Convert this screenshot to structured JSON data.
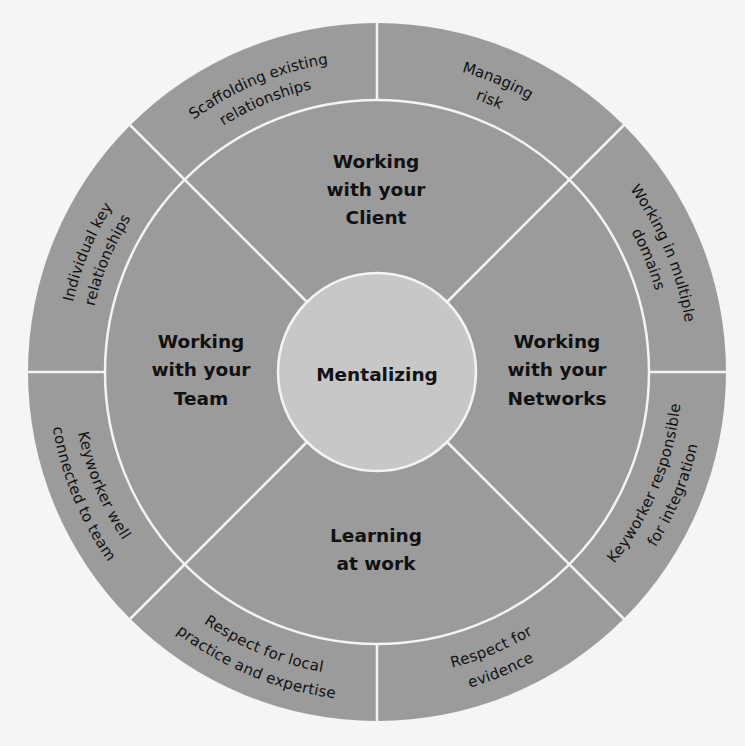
{
  "colors": {
    "background": "#f5f5f4",
    "ring_fill": "#9b9b9b",
    "center_fill": "#c7c7c7",
    "divider": "#f4f4f4",
    "text": "#111111"
  },
  "center": {
    "label": "Mentalizing"
  },
  "inner_sectors": [
    {
      "id": "client",
      "lines": [
        "Working",
        "with your",
        "Client"
      ]
    },
    {
      "id": "networks",
      "lines": [
        "Working",
        "with your",
        "Networks"
      ]
    },
    {
      "id": "learning",
      "lines": [
        "Learning",
        "at work"
      ]
    },
    {
      "id": "team",
      "lines": [
        "Working",
        "with your",
        "Team"
      ]
    }
  ],
  "outer_segments": [
    {
      "id": "scaffolding",
      "lines": [
        "Scaffolding existing",
        "relationships"
      ]
    },
    {
      "id": "managing-risk",
      "lines": [
        "Managing",
        "risk"
      ]
    },
    {
      "id": "multiple-domains",
      "lines": [
        "Working in multiple",
        "domains"
      ]
    },
    {
      "id": "responsible-integration",
      "lines": [
        "Keyworker responsible",
        "for integration"
      ]
    },
    {
      "id": "respect-evidence",
      "lines": [
        "Respect for",
        "evidence"
      ]
    },
    {
      "id": "respect-local",
      "lines": [
        "Respect for local",
        "practice and expertise"
      ]
    },
    {
      "id": "connected-team",
      "lines": [
        "Keyworker well",
        "connected to team"
      ]
    },
    {
      "id": "individual-key",
      "lines": [
        "Individual key",
        "relationships"
      ]
    }
  ]
}
